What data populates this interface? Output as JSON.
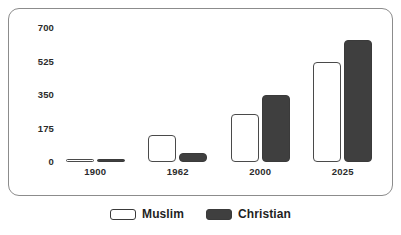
{
  "chart_data": {
    "type": "bar",
    "title": "",
    "xlabel": "",
    "ylabel": "",
    "categories": [
      "1900",
      "1962",
      "2000",
      "2025"
    ],
    "series": [
      {
        "name": "Muslim",
        "color": "#ffffff",
        "values": [
          15,
          140,
          250,
          525
        ]
      },
      {
        "name": "Christian",
        "color": "#3f3f3f",
        "values": [
          8,
          45,
          350,
          640
        ]
      }
    ],
    "yticks": [
      "0",
      "175",
      "350",
      "525",
      "700"
    ],
    "ytick_values": [
      0,
      175,
      350,
      525,
      700
    ],
    "ylim": [
      0,
      700
    ],
    "grid": false,
    "legend_position": "bottom"
  },
  "legend": {
    "items": [
      {
        "label": "Muslim",
        "swatch": "legend-swatch-muslim"
      },
      {
        "label": "Christian",
        "swatch": "legend-swatch-christian"
      }
    ]
  }
}
